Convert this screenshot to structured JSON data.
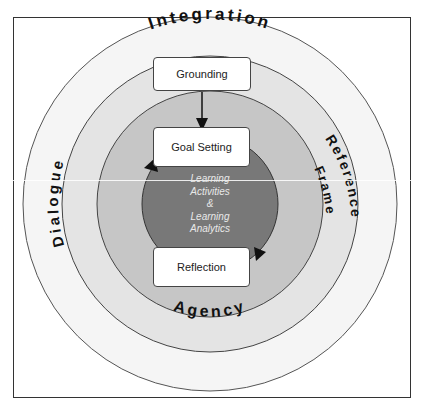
{
  "diagram": {
    "rings": [
      {
        "name": "outer",
        "label": "Integration",
        "color": "#f4f4f4"
      },
      {
        "name": "second-left",
        "label": "Dialogue",
        "color": "#e6e6e6"
      },
      {
        "name": "second-right",
        "label": "Reference Frame",
        "color": "#e6e6e6"
      },
      {
        "name": "third",
        "label": "Agency",
        "color": "#c8c8c8"
      },
      {
        "name": "core",
        "label": "Learning Activities & Learning Analytics",
        "color": "#7a7a7a"
      }
    ],
    "ring_labels": {
      "integration": "Integration",
      "dialogue": "Dialogue",
      "reference": "Reference",
      "frame": "Frame",
      "agency": "Agency"
    },
    "boxes": {
      "grounding": "Grounding",
      "goal_setting": "Goal Setting",
      "reflection": "Reflection"
    },
    "center": {
      "line1": "Learning",
      "line2": "Activities",
      "line3": "&",
      "line4": "Learning",
      "line5": "Analytics"
    }
  }
}
